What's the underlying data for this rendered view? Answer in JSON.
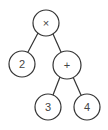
{
  "diagram": {
    "type": "expression-tree",
    "stroke_color": "#333333",
    "nodes": [
      {
        "id": "root",
        "label": "×",
        "x": 46,
        "y": 23,
        "r": 13
      },
      {
        "id": "left",
        "label": "2",
        "x": 22,
        "y": 64,
        "r": 13
      },
      {
        "id": "plus",
        "label": "+",
        "x": 67,
        "y": 65,
        "r": 14
      },
      {
        "id": "three",
        "label": "3",
        "x": 48,
        "y": 107,
        "r": 13
      },
      {
        "id": "four",
        "label": "4",
        "x": 87,
        "y": 107,
        "r": 13
      }
    ],
    "edges": [
      {
        "from": "root",
        "to": "left"
      },
      {
        "from": "root",
        "to": "plus"
      },
      {
        "from": "plus",
        "to": "three"
      },
      {
        "from": "plus",
        "to": "four"
      }
    ]
  }
}
